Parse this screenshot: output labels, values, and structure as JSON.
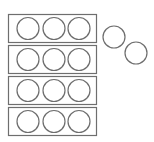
{
  "diagram": {
    "groups": [
      {
        "count": 3
      },
      {
        "count": 3
      },
      {
        "count": 3
      },
      {
        "count": 3
      }
    ],
    "loose_circles": 2,
    "group_size": 3,
    "total_circles": 14,
    "colors": {
      "stroke": "#6e6e6e",
      "background": "#ffffff"
    }
  }
}
